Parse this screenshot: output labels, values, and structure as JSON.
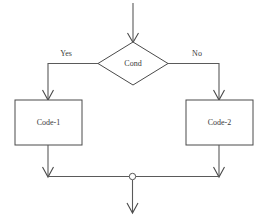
{
  "diagram": {
    "type": "flowchart",
    "background_color": "#ffffff",
    "line_color": "#5a5a5a",
    "text_color": "#3a3a3a",
    "nodes": {
      "decision": {
        "label": "Cond",
        "shape": "diamond"
      },
      "true_branch": {
        "label": "Code-1",
        "shape": "rectangle"
      },
      "false_branch": {
        "label": "Code-2",
        "shape": "rectangle"
      },
      "merge": {
        "label": "",
        "shape": "circle"
      }
    },
    "edges": {
      "entry": {
        "label": ""
      },
      "yes": {
        "label": "Yes"
      },
      "no": {
        "label": "No"
      },
      "true_to_merge": {
        "label": ""
      },
      "false_to_merge": {
        "label": ""
      },
      "exit": {
        "label": ""
      }
    }
  }
}
